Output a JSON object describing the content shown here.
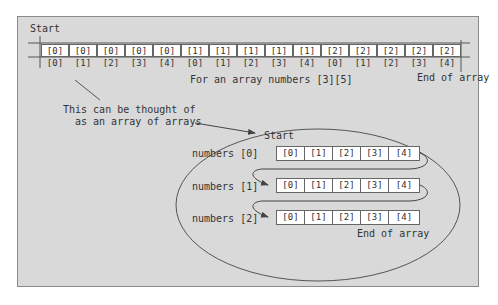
{
  "figure": {
    "top": {
      "start_label": "Start",
      "end_label": "End of array",
      "caption": "For an array numbers [3][5]",
      "cells": [
        "[0][0]",
        "[0][1]",
        "[0][2]",
        "[0][3]",
        "[0][4]",
        "[1][0]",
        "[1][1]",
        "[1][2]",
        "[1][3]",
        "[1][4]",
        "[2][0]",
        "[2][1]",
        "[2][2]",
        "[2][3]",
        "[2][4]"
      ]
    },
    "note": {
      "line1": "This can be thought of",
      "line2": "as an array of arrays"
    },
    "nested": {
      "start_label": "Start",
      "end_label": "End of array",
      "rows": [
        {
          "label": "numbers [0]",
          "cells": [
            "[0]",
            "[1]",
            "[2]",
            "[3]",
            "[4]"
          ]
        },
        {
          "label": "numbers [1]",
          "cells": [
            "[0]",
            "[1]",
            "[2]",
            "[3]",
            "[4]"
          ]
        },
        {
          "label": "numbers [2]",
          "cells": [
            "[0]",
            "[1]",
            "[2]",
            "[3]",
            "[4]"
          ]
        }
      ]
    },
    "colors": {
      "background": "#d9d9d9",
      "cell_fill": "#ffffff",
      "line": "#555555"
    }
  }
}
